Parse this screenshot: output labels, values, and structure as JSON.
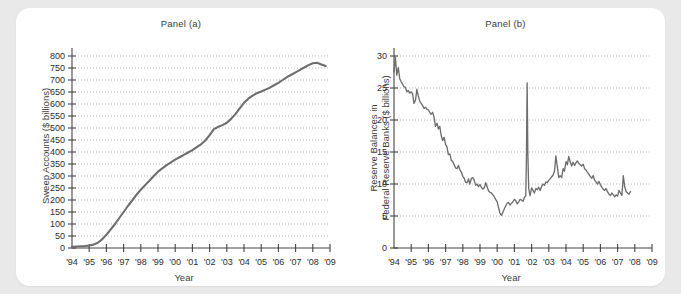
{
  "figure": {
    "background_color": "#e9e9e9",
    "card_color": "#ffffff",
    "line_color": "#6e6e6e",
    "axis_color": "#444444"
  },
  "panel_a": {
    "title": "Panel (a)",
    "xlabel": "Year",
    "ylabel": "Sweep Accounts ($ billions)"
  },
  "panel_b": {
    "title": "Panel (b)",
    "xlabel": "Year",
    "ylabel_line1": "Reserve Balances in",
    "ylabel_line2": "Federal Reserve Banks ($ billions)"
  },
  "chart_data": [
    {
      "type": "line",
      "panel": "Panel (a)",
      "title": "Panel (a)",
      "xlabel": "Year",
      "ylabel": "Sweep Accounts ($ billions)",
      "xlim": [
        1994,
        2009
      ],
      "ylim": [
        0,
        800
      ],
      "ytick_values": [
        0,
        50,
        100,
        150,
        200,
        250,
        300,
        350,
        400,
        450,
        500,
        550,
        600,
        650,
        700,
        750,
        800
      ],
      "ytick_labels": [
        "0",
        "50",
        "100",
        "150",
        "200",
        "250",
        "300",
        "350",
        "400",
        "450",
        "500",
        "550",
        "600",
        "650",
        "700",
        "750",
        "800"
      ],
      "xtick_values": [
        1994,
        1995,
        1996,
        1997,
        1998,
        1999,
        2000,
        2001,
        2002,
        2003,
        2004,
        2005,
        2006,
        2007,
        2008,
        2009
      ],
      "xtick_labels": [
        "'94",
        "'95",
        "'96",
        "'97",
        "'98",
        "'99",
        "'00",
        "'01",
        "'02",
        "'03",
        "'04",
        "'05",
        "'06",
        "'07",
        "'08",
        "'09"
      ],
      "grid": "horizontal-dotted",
      "legend": "none",
      "series": [
        {
          "name": "Sweep Accounts",
          "x": [
            1994.0,
            1994.25,
            1994.5,
            1994.75,
            1995.0,
            1995.25,
            1995.5,
            1995.75,
            1996.0,
            1996.25,
            1996.5,
            1996.75,
            1997.0,
            1997.25,
            1997.5,
            1997.75,
            1998.0,
            1998.25,
            1998.5,
            1998.75,
            1999.0,
            1999.25,
            1999.5,
            1999.75,
            2000.0,
            2000.25,
            2000.5,
            2000.75,
            2001.0,
            2001.25,
            2001.5,
            2001.75,
            2002.0,
            2002.25,
            2002.5,
            2002.75,
            2003.0,
            2003.25,
            2003.5,
            2003.75,
            2004.0,
            2004.25,
            2004.5,
            2004.75,
            2005.0,
            2005.25,
            2005.5,
            2005.75,
            2006.0,
            2006.25,
            2006.5,
            2006.75,
            2007.0,
            2007.25,
            2007.5,
            2007.75,
            2008.0,
            2008.25,
            2008.5,
            2008.75
          ],
          "y": [
            5,
            6,
            7,
            8,
            10,
            14,
            22,
            36,
            55,
            78,
            100,
            125,
            150,
            175,
            198,
            222,
            243,
            262,
            280,
            300,
            318,
            332,
            345,
            357,
            368,
            378,
            388,
            398,
            408,
            420,
            432,
            448,
            470,
            495,
            505,
            512,
            522,
            538,
            558,
            582,
            605,
            622,
            635,
            645,
            652,
            660,
            668,
            678,
            688,
            700,
            712,
            722,
            732,
            742,
            752,
            762,
            770,
            772,
            765,
            758
          ]
        }
      ]
    },
    {
      "type": "line",
      "panel": "Panel (b)",
      "title": "Panel (b)",
      "xlabel": "Year",
      "ylabel": "Reserve Balances in Federal Reserve Banks ($ billions)",
      "xlim": [
        1994,
        2009
      ],
      "ylim": [
        0,
        30
      ],
      "ytick_values": [
        0,
        5,
        10,
        15,
        20,
        25,
        30
      ],
      "ytick_labels": [
        "0",
        "5",
        "10",
        "15",
        "20",
        "25",
        "30"
      ],
      "xtick_values": [
        1994,
        1995,
        1996,
        1997,
        1998,
        1999,
        2000,
        2001,
        2002,
        2003,
        2004,
        2005,
        2006,
        2007,
        2008,
        2009
      ],
      "xtick_labels": [
        "'94",
        "'95",
        "'96",
        "'97",
        "'98",
        "'99",
        "'00",
        "'01",
        "'02",
        "'03",
        "'04",
        "'05",
        "'06",
        "'07",
        "'08",
        "'09"
      ],
      "grid": "horizontal-dotted",
      "legend": "none",
      "annotations": [
        {
          "label": "Y2K/Sept-2001 spike",
          "x": 2001.7,
          "y": 26.0
        }
      ],
      "series": [
        {
          "name": "Reserve Balances",
          "x": [
            1994.0,
            1994.08,
            1994.16,
            1994.25,
            1994.33,
            1994.41,
            1994.5,
            1994.58,
            1994.66,
            1994.75,
            1994.83,
            1994.91,
            1995.0,
            1995.08,
            1995.16,
            1995.25,
            1995.33,
            1995.41,
            1995.5,
            1995.58,
            1995.66,
            1995.75,
            1995.83,
            1995.91,
            1996.0,
            1996.08,
            1996.16,
            1996.25,
            1996.33,
            1996.41,
            1996.5,
            1996.58,
            1996.66,
            1996.75,
            1996.83,
            1996.91,
            1997.0,
            1997.08,
            1997.16,
            1997.25,
            1997.33,
            1997.41,
            1997.5,
            1997.58,
            1997.66,
            1997.75,
            1997.83,
            1997.91,
            1998.0,
            1998.08,
            1998.16,
            1998.25,
            1998.33,
            1998.41,
            1998.5,
            1998.58,
            1998.66,
            1998.75,
            1998.83,
            1998.91,
            1999.0,
            1999.08,
            1999.16,
            1999.25,
            1999.33,
            1999.41,
            1999.5,
            1999.58,
            1999.66,
            1999.75,
            1999.83,
            1999.91,
            2000.0,
            2000.08,
            2000.16,
            2000.25,
            2000.33,
            2000.41,
            2000.5,
            2000.58,
            2000.66,
            2000.75,
            2000.83,
            2000.91,
            2001.0,
            2001.08,
            2001.16,
            2001.25,
            2001.33,
            2001.41,
            2001.5,
            2001.58,
            2001.66,
            2001.7,
            2001.74,
            2001.78,
            2001.83,
            2001.91,
            2002.0,
            2002.08,
            2002.16,
            2002.25,
            2002.33,
            2002.41,
            2002.5,
            2002.58,
            2002.66,
            2002.75,
            2002.83,
            2002.91,
            2003.0,
            2003.08,
            2003.16,
            2003.25,
            2003.33,
            2003.41,
            2003.5,
            2003.58,
            2003.66,
            2003.75,
            2003.83,
            2003.91,
            2004.0,
            2004.08,
            2004.16,
            2004.25,
            2004.33,
            2004.41,
            2004.5,
            2004.58,
            2004.66,
            2004.75,
            2004.83,
            2004.91,
            2005.0,
            2005.08,
            2005.16,
            2005.25,
            2005.33,
            2005.41,
            2005.5,
            2005.58,
            2005.66,
            2005.75,
            2005.83,
            2005.91,
            2006.0,
            2006.08,
            2006.16,
            2006.25,
            2006.33,
            2006.41,
            2006.5,
            2006.58,
            2006.66,
            2006.75,
            2006.83,
            2006.91,
            2007.0,
            2007.08,
            2007.16,
            2007.25,
            2007.33,
            2007.41,
            2007.5,
            2007.58,
            2007.66,
            2007.75
          ],
          "y": [
            27.5,
            29.8,
            27.0,
            28.2,
            26.5,
            26.0,
            25.6,
            25.2,
            25.1,
            24.4,
            24.6,
            24.2,
            24.4,
            24.1,
            22.6,
            23.1,
            24.8,
            23.8,
            22.9,
            22.6,
            22.3,
            21.8,
            22.0,
            21.7,
            21.6,
            21.2,
            20.9,
            21.2,
            20.4,
            19.0,
            19.5,
            18.6,
            19.0,
            17.5,
            16.8,
            17.3,
            16.2,
            15.8,
            14.6,
            14.7,
            13.7,
            13.5,
            13.0,
            12.5,
            12.4,
            12.9,
            12.2,
            11.9,
            11.2,
            10.9,
            10.3,
            10.2,
            10.8,
            10.0,
            10.9,
            11.0,
            10.6,
            9.8,
            10.0,
            9.6,
            9.9,
            9.5,
            9.2,
            9.4,
            10.2,
            9.6,
            8.9,
            8.7,
            8.6,
            8.3,
            8.0,
            7.6,
            7.2,
            6.3,
            5.4,
            5.1,
            5.6,
            6.1,
            6.6,
            7.0,
            7.1,
            6.7,
            7.0,
            7.2,
            7.6,
            7.4,
            6.9,
            7.2,
            7.6,
            7.5,
            7.3,
            7.9,
            8.2,
            14.0,
            25.8,
            15.0,
            9.3,
            8.2,
            9.4,
            9.0,
            8.6,
            9.3,
            9.1,
            9.5,
            9.0,
            9.6,
            10.0,
            9.8,
            10.3,
            10.2,
            10.6,
            10.8,
            11.1,
            11.4,
            12.0,
            14.4,
            12.6,
            11.0,
            11.3,
            11.0,
            12.4,
            12.0,
            13.5,
            13.0,
            14.3,
            13.4,
            12.8,
            13.4,
            12.9,
            13.3,
            13.6,
            13.2,
            13.0,
            12.8,
            13.1,
            12.4,
            12.2,
            11.8,
            11.5,
            11.2,
            10.9,
            11.3,
            10.6,
            10.3,
            10.0,
            10.4,
            9.9,
            9.5,
            9.2,
            9.0,
            9.3,
            8.8,
            8.4,
            8.2,
            8.6,
            8.3,
            8.0,
            8.3,
            8.1,
            9.0,
            8.6,
            8.2,
            11.3,
            9.6,
            8.8,
            8.6,
            8.4,
            8.8
          ]
        }
      ]
    }
  ]
}
